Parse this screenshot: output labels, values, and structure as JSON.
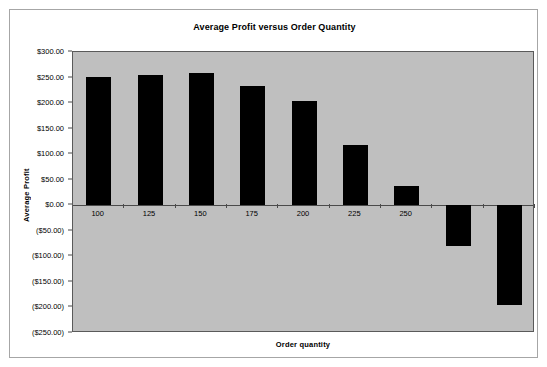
{
  "chart_data": {
    "type": "bar",
    "title": "Average Profit versus Order Quantity",
    "xlabel": "Order quantity",
    "ylabel": "Average Profit",
    "categories": [
      "100",
      "125",
      "150",
      "175",
      "200",
      "225",
      "250",
      "275",
      "300"
    ],
    "values": [
      251.0,
      255.0,
      259.0,
      234.0,
      204.0,
      118.0,
      38.0,
      -80.0,
      -196.0
    ],
    "ylim": [
      -250,
      300
    ],
    "ytick_values": [
      300,
      250,
      200,
      150,
      100,
      50,
      0,
      -50,
      -100,
      -150,
      -200,
      -250
    ],
    "ytick_labels": [
      "$300.00",
      "$250.00",
      "$200.00",
      "$150.00",
      "$100.00",
      "$50.00",
      "$0.00",
      "($50.00)",
      "($100.00)",
      "($150.00)",
      "($200.00)",
      "($250.00)"
    ],
    "visible_xtick_labels": [
      "100",
      "125",
      "150",
      "175",
      "200",
      "225",
      "250"
    ],
    "grid": false,
    "legend": false,
    "bar_color": "#000000",
    "plot_background": "#bfbfbf",
    "chart_background": "#ffffff",
    "axis_color": "#4a4a4a",
    "note": "Category labels for 275 and 300 are hidden behind the downward (negative) bars."
  }
}
